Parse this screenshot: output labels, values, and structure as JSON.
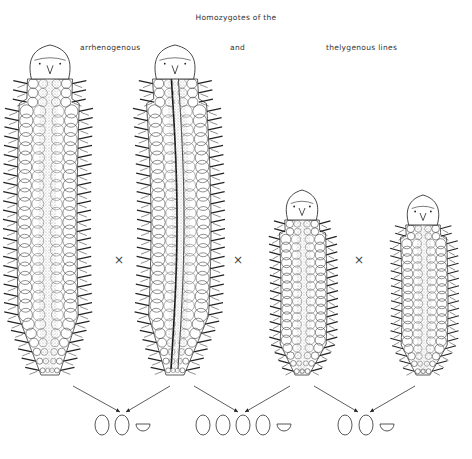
{
  "figure": {
    "title": "Homozygotes of the",
    "labels": {
      "arrhenogenous": "arrhenogenous",
      "and": "and",
      "thelygenous": "thelygenous lines"
    },
    "cross_symbol": "×",
    "worms": [
      {
        "id": "arrhenogenous-1",
        "line": "arrhenogenous",
        "size": "large",
        "x_center": 50,
        "top": 45,
        "bottom": 375
      },
      {
        "id": "arrhenogenous-2",
        "line": "arrhenogenous",
        "size": "large",
        "x_center": 175,
        "top": 45,
        "bottom": 375
      },
      {
        "id": "thelygenous-1",
        "line": "thelygenous",
        "size": "small",
        "x_center": 302,
        "top": 190,
        "bottom": 375
      },
      {
        "id": "thelygenous-2",
        "line": "thelygenous",
        "size": "small",
        "x_center": 423,
        "top": 195,
        "bottom": 375
      }
    ],
    "crosses": [
      {
        "between": [
          "arrhenogenous-1",
          "arrhenogenous-2"
        ],
        "x": 118
      },
      {
        "between": [
          "arrhenogenous-2",
          "thelygenous-1"
        ],
        "x": 237
      },
      {
        "between": [
          "thelygenous-1",
          "thelygenous-2"
        ],
        "x": 358
      }
    ],
    "offspring_groups": [
      {
        "parents": [
          "arrhenogenous-1",
          "arrhenogenous-2"
        ],
        "ovals": 2,
        "half_circles": 1
      },
      {
        "parents": [
          "arrhenogenous-2",
          "thelygenous-1"
        ],
        "ovals": 4,
        "half_circles": 1
      },
      {
        "parents": [
          "thelygenous-1",
          "thelygenous-2"
        ],
        "ovals": 2,
        "half_circles": 1
      }
    ]
  }
}
